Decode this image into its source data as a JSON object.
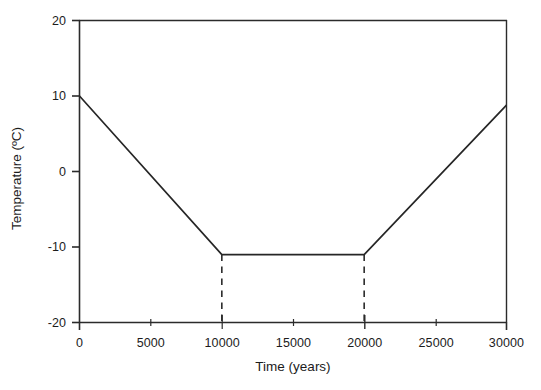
{
  "chart_data": {
    "type": "line",
    "title": "",
    "xlabel": "Time (years)",
    "ylabel": "Temperature (ºC)",
    "xlim": [
      0,
      30000
    ],
    "ylim": [
      -20,
      20
    ],
    "grid": false,
    "legend": null,
    "xticks": [
      0,
      5000,
      10000,
      15000,
      20000,
      25000,
      30000
    ],
    "xticklabels": [
      "0",
      "5000",
      "10000",
      "15000",
      "20000",
      "25000",
      "30000"
    ],
    "yticks": [
      20,
      10,
      0,
      -10,
      -20
    ],
    "yticklabels": [
      "20",
      "10",
      "0",
      "-10",
      "-20"
    ],
    "series": [
      {
        "name": "Temperature",
        "style": "solid",
        "color": "#262626",
        "x": [
          0,
          10000,
          20000,
          30000
        ],
        "values": [
          10,
          -11,
          -11,
          8.8
        ]
      }
    ],
    "annotations": [
      {
        "name": "drop-line-10000",
        "style": "dashed",
        "x": 10000,
        "y_from": -11,
        "y_to": -20
      },
      {
        "name": "drop-line-20000",
        "style": "dashed",
        "x": 20000,
        "y_from": -11,
        "y_to": -20
      }
    ],
    "frame": {
      "left": true,
      "bottom": true,
      "top": true,
      "right": true
    },
    "colors": {
      "axis": "#2b2b2b",
      "line": "#262626",
      "background": "#ffffff",
      "text": "#1c1c1c"
    }
  }
}
